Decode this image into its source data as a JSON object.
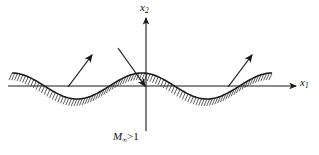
{
  "figure": {
    "background_color": "#ffffff",
    "ink_color": "#1a1a1a"
  },
  "axes": {
    "horizontal": {
      "name": "x1",
      "label_var": "x",
      "label_sub": "1",
      "y_position": 86,
      "x_start": 8,
      "x_end": 296
    },
    "vertical": {
      "name": "x2",
      "label_var": "x",
      "label_sub": "2",
      "x_position": 146,
      "y_top": 18,
      "y_bottom": 131
    }
  },
  "flow_label": {
    "symbol": "M",
    "subscript": "∞",
    "relation": ">1",
    "full_text": "M∞>1",
    "meaning": "supersonic-freestream-mach-number"
  },
  "wall": {
    "name": "wavy-wall",
    "description": "sinusoidal solid boundary with hatching on the solid side",
    "x_start": 12,
    "x_end": 272,
    "mean_y": 86,
    "amplitude": 13,
    "wavelength": 130,
    "phase_crest_x": 12,
    "hatch_count": 96,
    "hatch_length": 7,
    "hatch_slant_dx": -3
  },
  "mach_arrows": [
    {
      "name": "mach-wave-left",
      "direction": "up-right",
      "x1": 68,
      "y1": 87,
      "x2": 92,
      "y2": 55
    },
    {
      "name": "mach-wave-center-incident",
      "direction": "down-right",
      "x1": 118,
      "y1": 48,
      "x2": 145,
      "y2": 86
    },
    {
      "name": "mach-wave-right",
      "direction": "up-right",
      "x1": 228,
      "y1": 87,
      "x2": 252,
      "y2": 55
    }
  ],
  "chart_data": {
    "type": "line",
    "xlabel": "x1",
    "ylabel": "x2",
    "series": [
      {
        "name": "wavy wall surface",
        "function": "y = A*cos(2*pi*(x - x0)/L)",
        "amplitude": 13,
        "wavelength": 130,
        "x_range": [
          12,
          272
        ]
      }
    ],
    "annotations": [
      "M∞>1"
    ],
    "grid": false,
    "legend": "none"
  }
}
